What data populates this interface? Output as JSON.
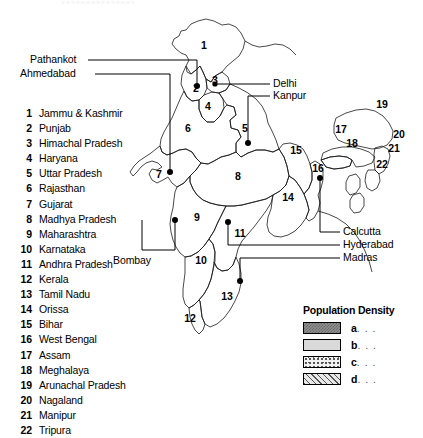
{
  "map": {
    "title": "India — Population Density",
    "country": "India",
    "state_index_label": "Numbered states",
    "states": [
      {
        "num": "1",
        "name": "Jammu & Kashmir",
        "density_class": "d"
      },
      {
        "num": "2",
        "name": "Punjab",
        "density_class": "c"
      },
      {
        "num": "3",
        "name": "Himachal Pradesh",
        "density_class": "white"
      },
      {
        "num": "4",
        "name": "Haryana",
        "density_class": "white"
      },
      {
        "num": "5",
        "name": "Uttar Pradesh",
        "density_class": "a"
      },
      {
        "num": "6",
        "name": "Rajasthan",
        "density_class": "d"
      },
      {
        "num": "7",
        "name": "Gujarat",
        "density_class": "c"
      },
      {
        "num": "8",
        "name": "Madhya Pradesh",
        "density_class": "d"
      },
      {
        "num": "9",
        "name": "Maharashtra",
        "density_class": "c"
      },
      {
        "num": "10",
        "name": "Karnataka",
        "density_class": "c"
      },
      {
        "num": "11",
        "name": "Andhra Pradesh",
        "density_class": "b"
      },
      {
        "num": "12",
        "name": "Kerala",
        "density_class": "b"
      },
      {
        "num": "13",
        "name": "Tamil Nadu",
        "density_class": "b"
      },
      {
        "num": "14",
        "name": "Orissa",
        "density_class": "d"
      },
      {
        "num": "15",
        "name": "Bihar",
        "density_class": "c"
      },
      {
        "num": "16",
        "name": "West Bengal",
        "density_class": "b"
      },
      {
        "num": "17",
        "name": "Assam",
        "density_class": "d"
      },
      {
        "num": "18",
        "name": "Meghalaya",
        "density_class": "c"
      },
      {
        "num": "19",
        "name": "Arunachal Pradesh",
        "density_class": "white"
      },
      {
        "num": "20",
        "name": "Nagaland",
        "density_class": "white"
      },
      {
        "num": "21",
        "name": "Manipur",
        "density_class": "white"
      },
      {
        "num": "22",
        "name": "Tripura",
        "density_class": "white"
      }
    ],
    "city_labels": [
      {
        "name": "Pathankot",
        "side": "left"
      },
      {
        "name": "Ahmedabad",
        "side": "left"
      },
      {
        "name": "Bombay",
        "side": "left"
      },
      {
        "name": "Delhi",
        "side": "right"
      },
      {
        "name": "Kanpur",
        "side": "right"
      },
      {
        "name": "Calcutta",
        "side": "right"
      },
      {
        "name": "Hyderabad",
        "side": "right"
      },
      {
        "name": "Madras",
        "side": "right"
      }
    ]
  },
  "legend": {
    "title": "Population Density",
    "dots": ". . .",
    "items": [
      {
        "key": "a",
        "label": "a",
        "pattern": "pat-a",
        "color": "#8f8f8f",
        "desc": "highest density"
      },
      {
        "key": "b",
        "label": "b",
        "pattern": "pat-b",
        "color": "#d9d9d9",
        "desc": "high density"
      },
      {
        "key": "c",
        "label": "c",
        "pattern": "pat-c",
        "color": "#f2f2f2",
        "desc": "medium density"
      },
      {
        "key": "d",
        "label": "d",
        "pattern": "pat-d",
        "color": "#e8e8e8",
        "desc": "low density"
      }
    ]
  }
}
